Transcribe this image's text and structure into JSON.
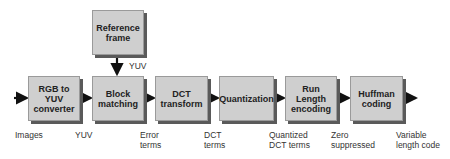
{
  "diagram": {
    "reference_box": {
      "label": "Reference frame",
      "line1": "Reference",
      "line2": "frame"
    },
    "reference_arrow_label": "YUV",
    "stages": [
      {
        "lines": [
          "RGB to",
          "YUV",
          "converter"
        ]
      },
      {
        "lines": [
          "Block",
          "matching"
        ]
      },
      {
        "lines": [
          "DCT",
          "transform"
        ]
      },
      {
        "lines": [
          "Quantization"
        ]
      },
      {
        "lines": [
          "Run",
          "Length",
          "encoding"
        ]
      },
      {
        "lines": [
          "Huffman",
          "coding"
        ]
      }
    ],
    "flow_labels": [
      {
        "lines": [
          "Images"
        ]
      },
      {
        "lines": [
          "YUV"
        ]
      },
      {
        "lines": [
          "Error",
          "terms"
        ]
      },
      {
        "lines": [
          "DCT",
          "terms"
        ]
      },
      {
        "lines": [
          "Quantized",
          "DCT terms"
        ]
      },
      {
        "lines": [
          "Zero",
          "suppressed"
        ]
      },
      {
        "lines": [
          "Variable",
          "length code"
        ]
      }
    ],
    "colors": {
      "box_fill": "#cfcfcf",
      "box_shadow": "#5a5a5a",
      "arrow": "#111111"
    }
  }
}
